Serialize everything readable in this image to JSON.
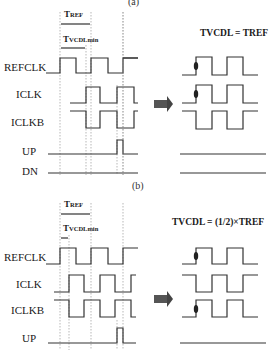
{
  "panel_a": {
    "caption": "(a)",
    "t_ref_label": "TREF",
    "t_vcdl_min_label": "TVCDLmin",
    "equation": "TVCDL = TREF",
    "signals": [
      "REFCLK",
      "ICLK",
      "ICLKB",
      "UP",
      "DN"
    ]
  },
  "panel_b": {
    "caption": "(b)",
    "t_ref_label": "TREF",
    "t_vcdl_min_label": "TVCDLmin",
    "equation": "TVCDL = (1/2)×TREF",
    "signals": [
      "REFCLK",
      "ICLK",
      "ICLKB",
      "UP"
    ]
  },
  "colors": {
    "line": "#333333",
    "guide": "#9a9a9a",
    "arrow": "#444444"
  }
}
